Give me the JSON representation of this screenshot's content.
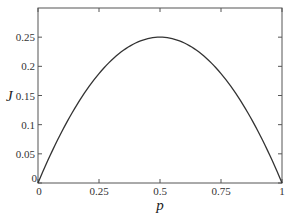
{
  "chart_data": {
    "type": "line",
    "title": "",
    "xlabel": "p",
    "ylabel": "J",
    "xlim": [
      0,
      1
    ],
    "ylim": [
      0,
      0.3
    ],
    "grid": false,
    "legend": null,
    "x_ticks": [
      0,
      0.25,
      0.5,
      0.75,
      1
    ],
    "x_tick_labels": [
      "0",
      "0.25",
      "0.5",
      "0.75",
      "1"
    ],
    "y_ticks": [
      0,
      0.05,
      0.1,
      0.15,
      0.2,
      0.25
    ],
    "y_tick_labels": [
      "0",
      "0.05",
      "0.1",
      "0.15",
      "0.2",
      "0.25"
    ],
    "series": [
      {
        "name": "J = p(1-p)",
        "x": [
          0,
          0.05,
          0.1,
          0.15,
          0.2,
          0.25,
          0.3,
          0.35,
          0.4,
          0.45,
          0.5,
          0.55,
          0.6,
          0.65,
          0.7,
          0.75,
          0.8,
          0.85,
          0.9,
          0.95,
          1
        ],
        "values": [
          0,
          0.0475,
          0.09,
          0.1275,
          0.16,
          0.1875,
          0.21,
          0.2275,
          0.24,
          0.2475,
          0.25,
          0.2475,
          0.24,
          0.2275,
          0.21,
          0.1875,
          0.16,
          0.1275,
          0.09,
          0.0475,
          0
        ],
        "color": "#333333"
      }
    ]
  }
}
